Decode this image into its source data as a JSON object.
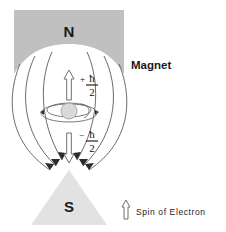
{
  "figure": {
    "title_visible": false,
    "background_color": "#ffffff"
  },
  "magnet": {
    "north": {
      "letter": "N",
      "fill_color": "#c0c0c0",
      "icon": "north-pole-block"
    },
    "south": {
      "letter": "S",
      "fill_color": "#e2e2e2",
      "icon": "south-pole-triangle"
    },
    "label": "Magnet"
  },
  "spin_states": {
    "up": {
      "sign": "+",
      "numerator": "ħ",
      "denominator": "2",
      "arrow_icon": "spin-up-arrow"
    },
    "down": {
      "sign": "−",
      "numerator": "ħ",
      "denominator": "2",
      "arrow_icon": "spin-down-arrow"
    }
  },
  "electron": {
    "nucleus_icon": "nucleus-circle",
    "orbit_icon": "electron-orbit",
    "nucleus_fill": "#d9d9d9"
  },
  "legend": {
    "arrow_icon": "spin-arrow-icon",
    "label": "Spin of Electron"
  },
  "field": {
    "line_color": "#5a5a5a",
    "arrow_color": "#2b2b2b",
    "line_count": 6
  }
}
